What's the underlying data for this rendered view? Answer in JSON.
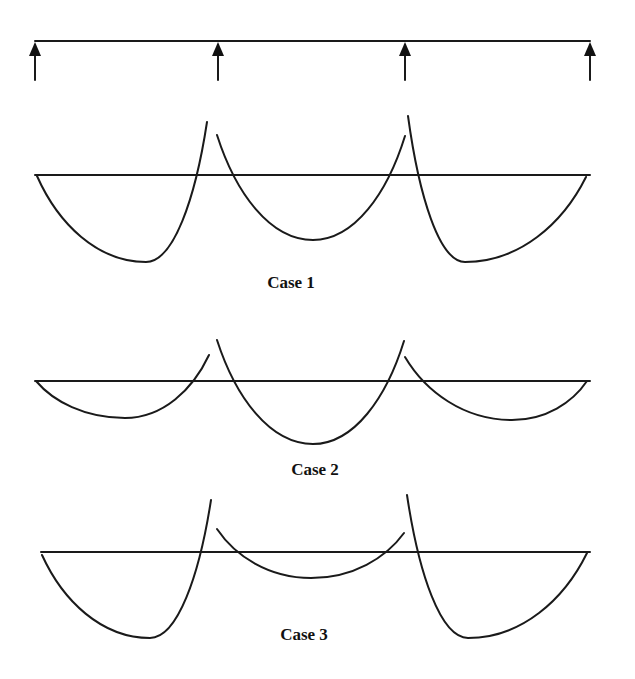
{
  "figure": {
    "width": 635,
    "height": 679,
    "stroke_color": "#1a1a1a",
    "background": "#ffffff"
  },
  "beam": {
    "y": 41,
    "x_start": 35,
    "x_end": 590,
    "supports": [
      {
        "x": 35,
        "tip_y": 42,
        "head_base_y": 56,
        "tail_y": 80
      },
      {
        "x": 218,
        "tip_y": 42,
        "head_base_y": 56,
        "tail_y": 80
      },
      {
        "x": 405,
        "tip_y": 42,
        "head_base_y": 56,
        "tail_y": 80
      },
      {
        "x": 590,
        "tip_y": 42,
        "head_base_y": 56,
        "tail_y": 80
      }
    ]
  },
  "cases": [
    {
      "label": "Case 1",
      "label_x": 291,
      "label_y": 288,
      "baseline": {
        "y": 175,
        "x_start": 35,
        "x_end": 590
      },
      "spans": [
        {
          "start": [
            37,
            176
          ],
          "min": [
            146,
            262
          ],
          "end": [
            207,
            122
          ]
        },
        {
          "start": [
            217,
            135
          ],
          "min": [
            313,
            240
          ],
          "end": [
            405,
            136
          ]
        },
        {
          "start": [
            408,
            116
          ],
          "min": [
            465,
            262
          ],
          "end": [
            586,
            177
          ]
        }
      ]
    },
    {
      "label": "Case 2",
      "label_x": 315,
      "label_y": 475,
      "baseline": {
        "y": 381,
        "x_start": 35,
        "x_end": 590
      },
      "spans": [
        {
          "start": [
            36,
            381
          ],
          "min": [
            125,
            418
          ],
          "end": [
            209,
            355
          ]
        },
        {
          "start": [
            217,
            340
          ],
          "min": [
            313,
            444
          ],
          "end": [
            404,
            341
          ]
        },
        {
          "start": [
            405,
            357
          ],
          "min": [
            512,
            420
          ],
          "end": [
            587,
            381
          ]
        }
      ]
    },
    {
      "label": "Case 3",
      "label_x": 304,
      "label_y": 640,
      "baseline": {
        "y": 552,
        "x_start": 41,
        "x_end": 590
      },
      "spans": [
        {
          "start": [
            42,
            555
          ],
          "min": [
            150,
            638
          ],
          "end": [
            211,
            500
          ]
        },
        {
          "start": [
            217,
            529
          ],
          "min": [
            311,
            578
          ],
          "end": [
            404,
            533
          ]
        },
        {
          "start": [
            407,
            495
          ],
          "min": [
            468,
            638
          ],
          "end": [
            587,
            553
          ]
        }
      ]
    }
  ]
}
